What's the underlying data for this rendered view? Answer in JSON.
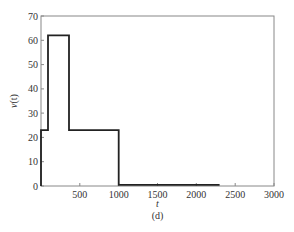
{
  "chart_data": {
    "type": "line",
    "style": "step",
    "title": "",
    "caption": "(d)",
    "xlabel": "t",
    "ylabel": "v(t)",
    "xlim": [
      0,
      3000
    ],
    "ylim": [
      0,
      70
    ],
    "xticks": [
      500,
      1000,
      1500,
      2000,
      2500,
      3000
    ],
    "yticks": [
      0,
      10,
      20,
      30,
      40,
      50,
      60,
      70
    ],
    "grid": false,
    "legend": null,
    "series": [
      {
        "name": "v(t)",
        "steps": [
          {
            "x_start": 0,
            "x_end": 90,
            "value": 23
          },
          {
            "x_start": 90,
            "x_end": 360,
            "value": 62
          },
          {
            "x_start": 360,
            "x_end": 1000,
            "value": 23
          },
          {
            "x_start": 1000,
            "x_end": 2300,
            "value": 0.5
          }
        ]
      }
    ]
  },
  "labels": {
    "x_axis": "t",
    "y_axis_v": "v",
    "y_axis_paren": "(t)",
    "caption": "(d)",
    "xtick_labels": [
      "500",
      "1000",
      "1500",
      "2000",
      "2500",
      "3000"
    ],
    "ytick_labels": [
      "0",
      "10",
      "20",
      "30",
      "40",
      "50",
      "60",
      "70"
    ]
  },
  "colors": {
    "line": "#222222",
    "axis": "#777777",
    "background": "#ffffff"
  }
}
